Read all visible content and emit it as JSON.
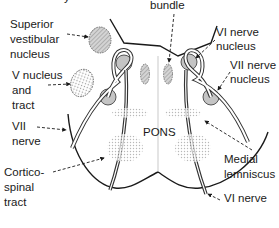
{
  "labels": {
    "top_partial": "y",
    "bundle": "bundle",
    "superior_vestibular": "Superior\nvestibular\nnucleus",
    "v_nucleus": "V nucleus\nand\ntract",
    "vi_nerve_nucleus": "VI nerve\nnucleus",
    "vii_nerve_nucleus": "VII nerve\nnucleus",
    "vii_nerve": "VII\nnerve",
    "pons": "PONS",
    "corticospinal": "Cortico-\nspinal\ntract",
    "medial_lemniscus": "Medial\nlemniscus",
    "vi_nerve": "VI nerve"
  },
  "colors": {
    "line": "#1a1a1a",
    "nucleus_fill": "#bdbdbd",
    "stipple": "#c8c8c8"
  }
}
